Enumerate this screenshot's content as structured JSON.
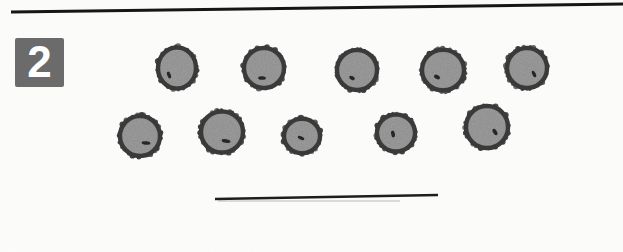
{
  "figure": {
    "number_label": "2",
    "content_description": "light micrograph plate: ten rounded spores with dark echinulate walls and a small dark pore each, arranged in two rows of five, above a horizontal scale bar",
    "canvas": {
      "width": 623,
      "height": 252
    },
    "colors": {
      "background": "#fcfcfb",
      "border_line": "#161616",
      "label_box_bg": "#6b6b6b",
      "label_text": "#ffffff",
      "spore_wall": "#3a3a3a",
      "spore_body": "#8f8f8f",
      "spore_pore": "#1d1d1d",
      "scale_bar": "#1e1e1e",
      "scale_bar_shadow": "#9a9a9a"
    },
    "border_line": {
      "x1": 11,
      "y1": 12,
      "x2": 623,
      "y2": 4,
      "width": 3
    },
    "label_box": {
      "x": 15,
      "y": 38,
      "w": 49,
      "h": 49,
      "font_size": 44
    },
    "scale_bar": {
      "x1": 215,
      "y1": 199,
      "x2": 438,
      "y2": 195,
      "width": 2.4,
      "shadow": {
        "x1": 218,
        "y1": 201,
        "x2": 400,
        "y2": 201,
        "width": 1.6
      }
    },
    "spores": [
      {
        "cx": 177,
        "cy": 68,
        "r": 21,
        "squish": 1.07,
        "seed": 11,
        "spot": {
          "dx": -8,
          "dy": 7,
          "angle": 70,
          "rx": 3.5,
          "ry": 1.8
        }
      },
      {
        "cx": 264,
        "cy": 68,
        "r": 22,
        "squish": 1.0,
        "seed": 22,
        "spot": {
          "dx": -2,
          "dy": 10,
          "angle": 5,
          "rx": 4.0,
          "ry": 1.8
        }
      },
      {
        "cx": 357,
        "cy": 70,
        "r": 22,
        "squish": 1.0,
        "seed": 33,
        "spot": {
          "dx": -5,
          "dy": 8,
          "angle": 25,
          "rx": 3.0,
          "ry": 1.8
        }
      },
      {
        "cx": 443,
        "cy": 70,
        "r": 23,
        "squish": 0.97,
        "seed": 44,
        "spot": {
          "dx": -6,
          "dy": 7,
          "angle": 30,
          "rx": 3.2,
          "ry": 2.0
        }
      },
      {
        "cx": 527,
        "cy": 68,
        "r": 22,
        "squish": 1.0,
        "seed": 55,
        "spot": {
          "dx": 7,
          "dy": 6,
          "angle": 65,
          "rx": 3.5,
          "ry": 1.7
        }
      },
      {
        "cx": 140,
        "cy": 136,
        "r": 22,
        "squish": 1.0,
        "seed": 66,
        "spot": {
          "dx": 6,
          "dy": 7,
          "angle": 5,
          "rx": 4.5,
          "ry": 1.8
        }
      },
      {
        "cx": 222,
        "cy": 132,
        "r": 23,
        "squish": 0.98,
        "seed": 77,
        "spot": {
          "dx": 4,
          "dy": 9,
          "angle": 10,
          "rx": 4.5,
          "ry": 1.9
        }
      },
      {
        "cx": 302,
        "cy": 136,
        "r": 20,
        "squish": 0.96,
        "seed": 88,
        "spot": {
          "dx": -1,
          "dy": 2,
          "angle": 25,
          "rx": 3.5,
          "ry": 1.7
        }
      },
      {
        "cx": 396,
        "cy": 133,
        "r": 21,
        "squish": 0.98,
        "seed": 99,
        "spot": {
          "dx": -3,
          "dy": 1,
          "angle": 80,
          "rx": 3.4,
          "ry": 1.9
        }
      },
      {
        "cx": 487,
        "cy": 127,
        "r": 23,
        "squish": 1.0,
        "seed": 110,
        "spot": {
          "dx": 8,
          "dy": 5,
          "angle": 60,
          "rx": 3.6,
          "ry": 1.9
        }
      }
    ]
  }
}
